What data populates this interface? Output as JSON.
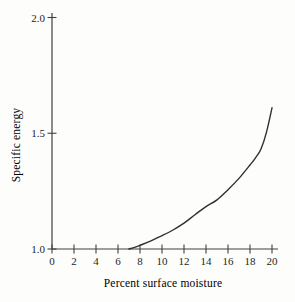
{
  "figure": {
    "background": "#fdfdfb",
    "width": 295,
    "height": 302
  },
  "chart_data": {
    "type": "line",
    "title": "",
    "xlabel": "Percent surface moisture",
    "ylabel": "Specific energy",
    "xlim": [
      0,
      20
    ],
    "ylim": [
      1.0,
      2.0
    ],
    "grid": false,
    "legend": "none",
    "x_ticks": [
      0,
      2,
      4,
      6,
      8,
      10,
      12,
      14,
      16,
      18,
      20
    ],
    "x_tick_labels": [
      "0",
      "2",
      "4",
      "6",
      "8",
      "10",
      "12",
      "14",
      "16",
      "18",
      "20"
    ],
    "y_ticks": [
      1.0,
      1.5,
      2.0
    ],
    "y_tick_labels": [
      "1.0",
      "1.5",
      "2.0"
    ],
    "series": [
      {
        "name": "specific-energy-vs-moisture",
        "color": "#303030",
        "x": [
          7.0,
          7.5,
          8.0,
          9.0,
          10.0,
          11.0,
          12.0,
          13.0,
          14.0,
          15.0,
          16.0,
          17.0,
          18.0,
          18.5,
          19.0,
          19.5,
          20.0
        ],
        "y": [
          1.0,
          1.007,
          1.016,
          1.035,
          1.058,
          1.082,
          1.112,
          1.148,
          1.183,
          1.212,
          1.256,
          1.305,
          1.363,
          1.394,
          1.432,
          1.505,
          1.61
        ]
      }
    ],
    "colors": {
      "axis": "#404040",
      "text": "#1f1f1f",
      "curve": "#303030"
    }
  }
}
